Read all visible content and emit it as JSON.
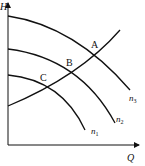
{
  "diagram": {
    "type": "pump-characteristic-curves",
    "axes": {
      "y_label": "H",
      "x_label": "Q"
    },
    "pump_curves": [
      {
        "name": "n1",
        "label_main": "n",
        "label_sub": "1"
      },
      {
        "name": "n2",
        "label_main": "n",
        "label_sub": "2"
      },
      {
        "name": "n3",
        "label_main": "n",
        "label_sub": "3"
      }
    ],
    "operating_points": [
      {
        "label": "A",
        "on_curve": "n3"
      },
      {
        "label": "B",
        "on_curve": "n2"
      },
      {
        "label": "C",
        "on_curve": "n1"
      }
    ],
    "colors": {
      "line": "#111111",
      "background": "#ffffff"
    }
  }
}
